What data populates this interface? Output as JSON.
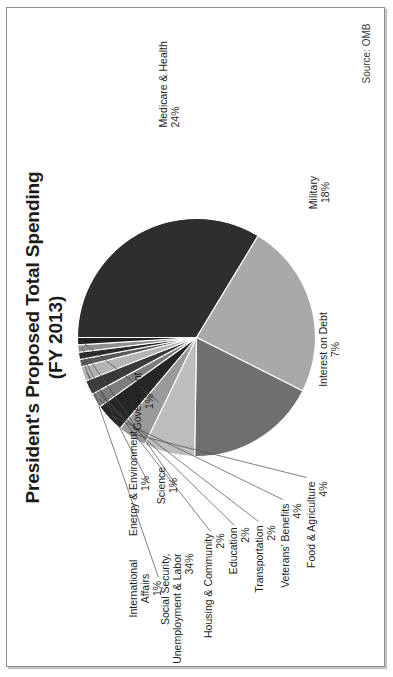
{
  "figure": {
    "title_line1": "President's Proposed Total Spending",
    "title_line2": "(FY 2013)",
    "source": "Source: OMB"
  },
  "chart_data": {
    "type": "pie",
    "title": "President's Proposed Total Spending (FY 2013)",
    "subtitle": "(FY 2013)",
    "source": "Source: OMB",
    "value_unit": "percent of total spending",
    "labels_show_percent": true,
    "legend": "none (direct labels with leader lines)",
    "grid": false,
    "rotation_deg": -90,
    "start_angle_deg": 90,
    "direction": "clockwise",
    "categories": [
      "Social Security, Unemployment & Labor",
      "Medicare & Health",
      "Military",
      "Interest on Debt",
      "Food & Agriculture",
      "Veterans' Benefits",
      "Transportation",
      "Education",
      "Housing & Community",
      "International Affairs",
      "Energy & Environment",
      "Science",
      "Government"
    ],
    "values": [
      34,
      24,
      18,
      7,
      4,
      4,
      2,
      2,
      2,
      1,
      1,
      1,
      1
    ],
    "value_labels": [
      "34%",
      "24%",
      "18%",
      "7%",
      "4%",
      "4%",
      "2%",
      "2%",
      "2%",
      "1%",
      "1%",
      "1%",
      "1%"
    ],
    "colors": [
      "#2e2e2e",
      "#a9a9a9",
      "#6f6f6f",
      "#bdbdbd",
      "#9a9a9a",
      "#262626",
      "#7d7d7d",
      "#3a3a3a",
      "#b4b4b4",
      "#5a5a5a",
      "#2b2b2b",
      "#8f8f8f",
      "#1f1f1f"
    ]
  },
  "slices": [
    {
      "name": "Social Security, Unemployment & Labor",
      "label_line1": "Social Security,",
      "label_line2": "Unemployment & Labor",
      "pct": "34%"
    },
    {
      "name": "Medicare & Health",
      "label_line1": "Medicare & Health",
      "pct": "24%"
    },
    {
      "name": "Military",
      "label_line1": "Military",
      "pct": "18%"
    },
    {
      "name": "Interest on Debt",
      "label_line1": "Interest on Debt",
      "pct": "7%"
    },
    {
      "name": "Food & Agriculture",
      "label_line1": "Food & Agriculture",
      "pct": "4%"
    },
    {
      "name": "Veterans' Benefits",
      "label_line1": "Veterans' Benefits",
      "pct": "4%"
    },
    {
      "name": "Transportation",
      "label_line1": "Transportation",
      "pct": "2%"
    },
    {
      "name": "Education",
      "label_line1": "Education",
      "pct": "2%"
    },
    {
      "name": "Housing & Community",
      "label_line1": "Housing & Community",
      "pct": "2%"
    },
    {
      "name": "International Affairs",
      "label_line1": "International",
      "label_line2": "Affairs",
      "pct": "1%"
    },
    {
      "name": "Energy & Environment",
      "label_line1": "Energy & Environment",
      "pct": "1%"
    },
    {
      "name": "Science",
      "label_line1": "Science",
      "pct": "1%"
    },
    {
      "name": "Government",
      "label_line1": "Government",
      "pct": "1%"
    }
  ]
}
